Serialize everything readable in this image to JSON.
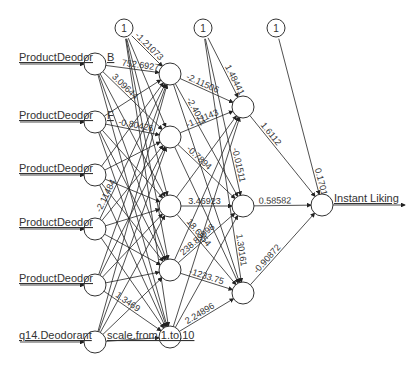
{
  "diagram": {
    "type": "neural-network",
    "inputs": [
      {
        "label": "ProductDeodorantB",
        "node": [
          95,
          64
        ]
      },
      {
        "label": "ProductDeodorantF",
        "node": [
          95,
          122
        ]
      },
      {
        "label": "ProductDeodorantG",
        "node": [
          95,
          175
        ]
      },
      {
        "label": "ProductDeodorantH",
        "node": [
          95,
          229
        ]
      },
      {
        "label": "ProductDeodorantJ",
        "node": [
          95,
          285
        ]
      },
      {
        "label": "q14.Deodorant.overall.on.a.scale.from.1.to.10",
        "node": [
          95,
          342
        ]
      }
    ],
    "input_label_texts": [
      "ProductDeodor",
      "ProductDeodor",
      "ProductDeodor",
      "ProductDeodor",
      "ProductDeodor",
      "q14.Deodorant"
    ],
    "input_label_suffixes": [
      "B",
      "F",
      "",
      "",
      "",
      "scale.from.1.to.10"
    ],
    "hidden1": [
      [
        170,
        74
      ],
      [
        170,
        137
      ],
      [
        170,
        206
      ],
      [
        170,
        270
      ],
      [
        170,
        337
      ]
    ],
    "hidden2": [
      [
        243,
        107
      ],
      [
        243,
        206
      ],
      [
        243,
        293
      ]
    ],
    "output": {
      "label": "Instant Liking",
      "node": [
        322,
        205
      ]
    },
    "bias_nodes": [
      {
        "label": "1",
        "node": [
          124,
          28
        ]
      },
      {
        "label": "1",
        "node": [
          203,
          28
        ]
      },
      {
        "label": "1",
        "node": [
          276,
          28
        ]
      }
    ],
    "weights_visible": {
      "bias_to_h1": [
        "-1.21073"
      ],
      "input_to_h1": [
        "752.69277",
        "3.09644",
        "-0.80426",
        "1.3469",
        "-2.11484",
        "-7.37302"
      ],
      "h1_labels_other": [
        "-0.684",
        "1.61008",
        "-0.4474",
        "-1.7144",
        "-0.3144",
        "3.6751",
        "1.9613",
        "1.92385",
        "-0.9546"
      ],
      "h1_to_h2": [
        "-2.11506",
        "-2.4071",
        "-1.11143",
        "-0.7894",
        "-0.12285",
        "3.46923",
        "18.6954",
        "238.89998",
        "-1233.75",
        "2.24896",
        "1.85"
      ],
      "bias_to_h2": [
        "1.48441",
        "-0.01511",
        "1.30161"
      ],
      "h2_to_out": [
        "1.6112",
        "0.58582",
        "-0.90872"
      ],
      "bias_to_out": [
        "0.17015"
      ],
      "other_partial": [
        "-8.9764",
        "-6.81",
        "1.64",
        "-0.1746"
      ]
    }
  }
}
